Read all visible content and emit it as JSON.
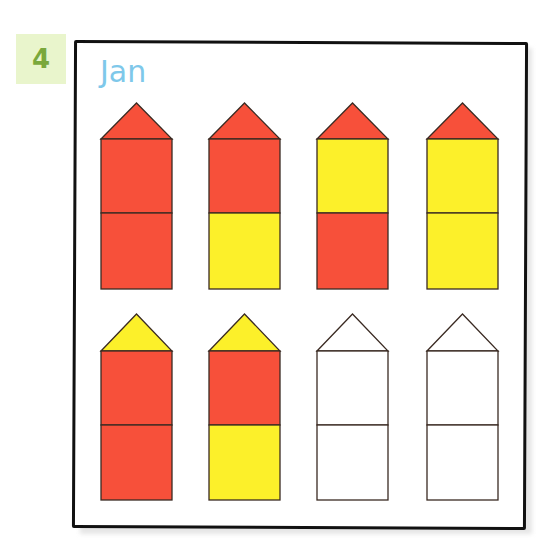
{
  "exercise_number": "4",
  "name_label": "Jan",
  "colors": {
    "red": "#f7503a",
    "yellow": "#fcf02a",
    "blank": "#ffffff",
    "outline": "#3a2a22",
    "badge_bg": "#e9f5cc",
    "badge_text": "#7aa83c",
    "title_text": "#7ec8ea"
  },
  "houses": [
    {
      "row": 1,
      "col": 1,
      "roof": "red",
      "top": "red",
      "bottom": "red"
    },
    {
      "row": 1,
      "col": 2,
      "roof": "red",
      "top": "red",
      "bottom": "yellow"
    },
    {
      "row": 1,
      "col": 3,
      "roof": "red",
      "top": "yellow",
      "bottom": "red"
    },
    {
      "row": 1,
      "col": 4,
      "roof": "red",
      "top": "yellow",
      "bottom": "yellow"
    },
    {
      "row": 2,
      "col": 1,
      "roof": "yellow",
      "top": "red",
      "bottom": "red"
    },
    {
      "row": 2,
      "col": 2,
      "roof": "yellow",
      "top": "red",
      "bottom": "yellow"
    },
    {
      "row": 2,
      "col": 3,
      "roof": "blank",
      "top": "blank",
      "bottom": "blank"
    },
    {
      "row": 2,
      "col": 4,
      "roof": "blank",
      "top": "blank",
      "bottom": "blank"
    }
  ]
}
